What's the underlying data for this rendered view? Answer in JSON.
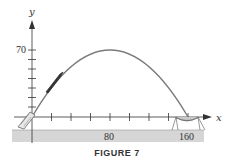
{
  "figure": {
    "caption": "FIGURE 7",
    "x_axis_label": "x",
    "y_axis_label": "y",
    "x_tick_labels": [
      {
        "value": 80,
        "text": "80"
      },
      {
        "value": 160,
        "text": "160"
      }
    ],
    "y_tick_labels": [
      {
        "value": 70,
        "text": "70"
      }
    ],
    "x_tick_step": 20,
    "y_tick_step": 10,
    "trajectory": {
      "type": "parabola",
      "start": [
        0,
        0
      ],
      "peak": [
        80,
        70
      ],
      "end": [
        160,
        0
      ]
    },
    "objects": {
      "launcher": "cannon at origin",
      "projectile": "projectile on ascending path",
      "catcher": "net at x = 160"
    },
    "colors": {
      "curve": "#7a7a7a",
      "axis": "#333333",
      "ground": "#d4d4d4",
      "projectile": "#333333"
    }
  }
}
